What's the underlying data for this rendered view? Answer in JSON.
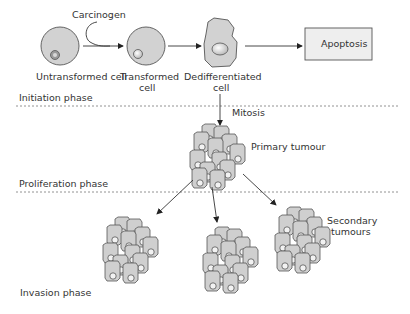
{
  "labels": {
    "carcinogen": "Carcinogen",
    "untransformed": "Untransformed cell",
    "transformed_1": "Transformed",
    "transformed_2": "cell",
    "dediff_1": "Dedifferentiated",
    "dediff_2": "cell",
    "apoptosis": "Apoptosis",
    "mitosis": "Mitosis",
    "primary": "Primary tumour",
    "secondary_1": "Secondary",
    "secondary_2": "tumours"
  },
  "phases": [
    {
      "name": "Initiation phase"
    },
    {
      "name": "Proliferation phase"
    },
    {
      "name": "Invasion phase"
    }
  ],
  "colors": {
    "cell_fill": "#d2d2d2",
    "stroke": "#555555",
    "nucleus_fill": "#e8e8e8",
    "box_fill": "#eeeeee",
    "text": "#333333"
  }
}
